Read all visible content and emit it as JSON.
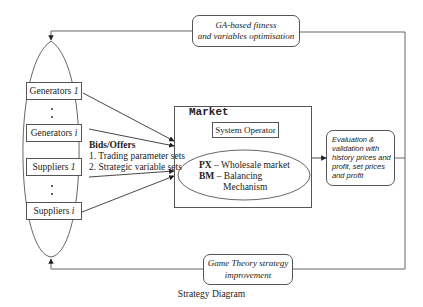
{
  "caption": "Strategy Diagram",
  "participants": {
    "generators_1": {
      "label": "Generators",
      "index": "1"
    },
    "generators_i": {
      "label": "Generators",
      "index": "i"
    },
    "suppliers_1": {
      "label": "Suppliers",
      "index": "1"
    },
    "suppliers_i": {
      "label": "Suppliers",
      "index": "i"
    }
  },
  "bids": {
    "title": "Bids/Offers",
    "items": [
      "1. Trading parameter sets",
      "2. Strategic variable sets"
    ]
  },
  "market": {
    "title": "Market",
    "system_operator": "System Operator",
    "px_abbr": "PX",
    "px_desc": "– Wholesale market",
    "bm_abbr": "BM",
    "bm_desc_line1": "– Balancing",
    "bm_desc_line2": "Mechanism"
  },
  "evaluation": {
    "lines": [
      "Evaluation &",
      "validation with",
      "history prices and",
      "profit, set prices",
      "and profit"
    ]
  },
  "ga_box": {
    "line1": "GA-based fitness",
    "line2": "and variables optimisation"
  },
  "game_theory_box": {
    "line1": "Game Theory strategy",
    "line2": "improvement"
  },
  "colors": {
    "line": "#555555",
    "text": "#222222",
    "background": "#ffffff"
  }
}
